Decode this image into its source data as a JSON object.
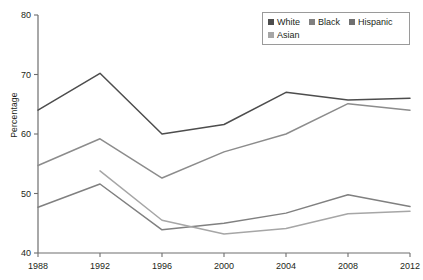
{
  "chart_data": {
    "type": "line",
    "title": "",
    "subtitle": "",
    "xlabel": "",
    "ylabel": "Percentage",
    "x": [
      1988,
      1992,
      1996,
      2000,
      2004,
      2008,
      2012
    ],
    "categories": [
      "1988",
      "1992",
      "1996",
      "2000",
      "2004",
      "2008",
      "2012"
    ],
    "xlim": [
      1988,
      2012
    ],
    "ylim": [
      40,
      80
    ],
    "yticks": [
      40,
      50,
      60,
      70,
      80
    ],
    "ytick_labels": [
      "40",
      "50",
      "60",
      "70",
      "80"
    ],
    "xticks": [
      1988,
      1992,
      1996,
      2000,
      2004,
      2008,
      2012
    ],
    "xtick_labels": [
      "1988",
      "1992",
      "1996",
      "2000",
      "2004",
      "2008",
      "2012"
    ],
    "grid": false,
    "legend_position": "top-right",
    "series": [
      {
        "name": "White",
        "color": "#4d4d4d",
        "x": [
          1988,
          1992,
          1996,
          2000,
          2004,
          2008,
          2012
        ],
        "values": [
          64.0,
          70.2,
          60.0,
          61.6,
          67.0,
          65.7,
          66.0
        ]
      },
      {
        "name": "Black",
        "color": "#808080",
        "x": [
          1988,
          1992,
          1996,
          2000,
          2004,
          2008,
          2012
        ],
        "values": [
          47.7,
          51.6,
          43.9,
          45.0,
          46.7,
          49.8,
          47.8
        ]
      },
      {
        "name": "Hispanic",
        "color": "#a6a6a6",
        "x": [
          1992,
          1996,
          2000,
          2004,
          2008,
          2012
        ],
        "values": [
          53.8,
          45.5,
          43.2,
          44.1,
          46.6,
          47.0
        ]
      },
      {
        "name": "Asian",
        "color": "#8c8c8c",
        "x": [
          1988,
          1992,
          1996,
          2000,
          2004,
          2008,
          2012
        ],
        "values": [
          54.7,
          59.2,
          52.6,
          57.0,
          60.0,
          65.1,
          64.0
        ]
      }
    ]
  },
  "legend": {
    "rows": [
      [
        {
          "label": "White",
          "color": "#4d4d4d"
        },
        {
          "label": "Black",
          "color": "#808080"
        },
        {
          "label": "Hispanic",
          "color": "#707070"
        }
      ],
      [
        {
          "label": "Asian",
          "color": "#a6a6a6"
        }
      ]
    ]
  },
  "axis": {
    "y_title": "Percentage"
  }
}
